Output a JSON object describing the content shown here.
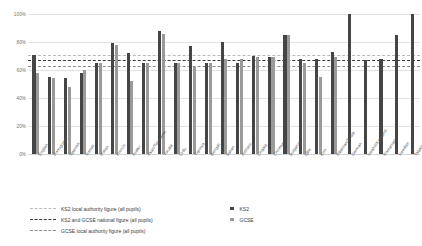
{
  "chart_data": {
    "type": "bar",
    "title": "",
    "xlabel": "",
    "ylabel": "",
    "ylim": [
      0,
      100
    ],
    "ytick_labels": [
      "0%",
      "20%",
      "40%",
      "60%",
      "80%",
      "100%"
    ],
    "ytick_values": [
      0,
      20,
      40,
      60,
      80,
      100
    ],
    "grid": true,
    "legend_position": "bottom",
    "categories": [
      "English",
      "Portuguese",
      "Spanish",
      "Somali",
      "Polish",
      "French",
      "Arabic",
      "Akan/Twi-Fante",
      "Yoruba",
      "Urdu",
      "Tigrinya",
      "Bengali",
      "Italian",
      "Amharic",
      "Lingala",
      "Chinese",
      "Bulgarian",
      "Igbo",
      "Krio",
      "Albanian/Shqip",
      "German",
      "Swahili/Kiswahili",
      "Romanian",
      "Swedish",
      "Tagalog/Filipino"
    ],
    "series": [
      {
        "name": "KS2",
        "color": "#454545",
        "values": [
          71,
          55,
          54,
          58,
          65,
          79,
          72,
          65,
          88,
          65,
          77,
          65,
          80,
          65,
          70,
          69,
          85,
          68,
          68,
          73,
          100,
          67,
          68,
          85,
          100
        ]
      },
      {
        "name": "GCSE",
        "color": "#9a9a9a",
        "values": [
          58,
          54,
          48,
          60,
          65,
          78,
          52,
          65,
          86,
          65,
          62,
          65,
          68,
          68,
          69,
          69,
          85,
          65,
          55,
          69,
          null,
          null,
          null,
          null,
          null
        ]
      }
    ],
    "reference_lines": [
      {
        "label": "KS2 local authority figure (all pupils)",
        "value": 71,
        "style": "light",
        "color": "#bdbdbd"
      },
      {
        "label": "KS2 and GCSE national figure (all pupils)",
        "value": 67,
        "style": "dark",
        "color": "#3a3a3a"
      },
      {
        "label": "GCSE local authority figure (all pupils)",
        "value": 63,
        "style": "mid",
        "color": "#8d8d8d"
      }
    ]
  },
  "legend": {
    "reference_entries": [
      "KS2 local authority figure (all pupils)",
      "KS2 and GCSE national figure (all pupils)",
      "GCSE local authority figure (all pupils)"
    ],
    "series_entries": [
      "KS2",
      "GCSE"
    ]
  }
}
